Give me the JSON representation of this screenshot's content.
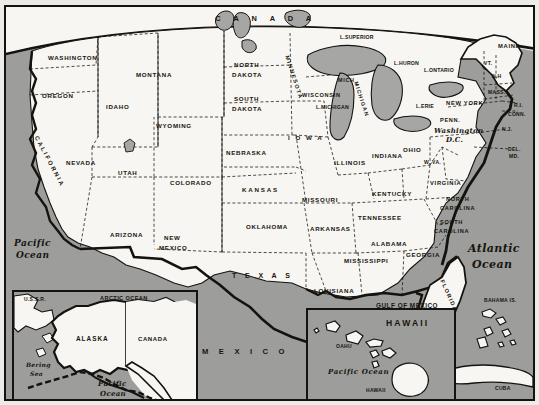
{
  "map": {
    "title": "United States political map with Alaska and Hawaii insets",
    "colors": {
      "ocean": "#9d9d9b",
      "land": "#f7f6f2",
      "border": "#15130f",
      "lake": "#a6a6a4",
      "paper": "#ecebe7"
    },
    "countries": [
      {
        "name": "canada-label",
        "text": "C A N A D A",
        "x": 160,
        "y": 10
      },
      {
        "name": "mexico-label",
        "text": "M E X I C O",
        "x": 196,
        "y": 343
      },
      {
        "name": "cuba-label",
        "text": "CUBA",
        "x": 489,
        "y": 381
      },
      {
        "name": "bahama-label",
        "text": "BAHAMA IS.",
        "x": 482,
        "y": 293
      },
      {
        "name": "ussr-label",
        "text": "U.S.S.R.",
        "x": 16,
        "y": 288
      }
    ],
    "oceans": [
      {
        "name": "pacific-ocean-west",
        "line1": "Pacific",
        "line2": "Ocean",
        "x": 10,
        "y": 236
      },
      {
        "name": "atlantic-ocean",
        "line1": "Atlantic",
        "line2": "Ocean",
        "x": 462,
        "y": 240
      },
      {
        "name": "gulf-of-mexico",
        "text": "GULF OF MEXICO",
        "x": 374,
        "y": 298
      },
      {
        "name": "arctic-ocean",
        "text": "ARCTIC OCEAN",
        "x": 128,
        "y": 287
      },
      {
        "name": "bering-sea",
        "line1": "Bering",
        "line2": "Sea",
        "x": 17,
        "y": 356
      },
      {
        "name": "pacific-ocean-alaska",
        "line1": "Pacific",
        "line2": "Ocean",
        "x": 92,
        "y": 376
      },
      {
        "name": "pacific-ocean-hawaii",
        "text": "Pacific  Ocean",
        "x": 322,
        "y": 362
      }
    ],
    "lakes": [
      {
        "name": "lake-superior",
        "text": "L.SUPERIOR",
        "x": 334,
        "y": 30
      },
      {
        "name": "lake-huron",
        "text": "L.HURON",
        "x": 388,
        "y": 56
      },
      {
        "name": "lake-ontario",
        "text": "L.ONTARIO",
        "x": 418,
        "y": 63
      },
      {
        "name": "lake-erie",
        "text": "L.ERIE",
        "x": 410,
        "y": 99
      },
      {
        "name": "lake-michigan",
        "text": "L.MICHIGAN",
        "x": 316,
        "y": 100
      }
    ],
    "states": [
      {
        "name": "washington",
        "text": "WASHINGTON",
        "x": 68,
        "y": 50
      },
      {
        "name": "oregon",
        "text": "OREGON",
        "x": 46,
        "y": 88
      },
      {
        "name": "idaho",
        "text": "IDAHO",
        "x": 104,
        "y": 99
      },
      {
        "name": "montana",
        "text": "MONTANA",
        "x": 155,
        "y": 67
      },
      {
        "name": "wyoming",
        "text": "WYOMING",
        "x": 164,
        "y": 118
      },
      {
        "name": "nevada",
        "text": "NEVADA",
        "x": 76,
        "y": 155
      },
      {
        "name": "utah",
        "text": "UTAH",
        "x": 124,
        "y": 165
      },
      {
        "name": "colorado",
        "text": "COLORADO",
        "x": 178,
        "y": 175
      },
      {
        "name": "arizona",
        "text": "ARIZONA",
        "x": 119,
        "y": 227
      },
      {
        "name": "new-mexico",
        "line1": "NEW",
        "line2": "MEXICO",
        "x": 175,
        "y": 232
      },
      {
        "name": "california",
        "text": "CALIFORNIA",
        "x": 33,
        "y": 140
      },
      {
        "name": "north-dakota",
        "line1": "NORTH",
        "line2": "DAKOTA",
        "x": 245,
        "y": 59
      },
      {
        "name": "south-dakota",
        "line1": "SOUTH",
        "line2": "DAKOTA",
        "x": 243,
        "y": 93
      },
      {
        "name": "nebraska",
        "text": "NEBRASKA",
        "x": 244,
        "y": 145
      },
      {
        "name": "kansas",
        "text": "KANSAS",
        "x": 257,
        "y": 182
      },
      {
        "name": "oklahoma",
        "text": "OKLAHOMA",
        "x": 263,
        "y": 219
      },
      {
        "name": "texas",
        "text": "T E X A S",
        "x": 237,
        "y": 268
      },
      {
        "name": "minnesota",
        "text": "MINNESOTA",
        "x": 283,
        "y": 55
      },
      {
        "name": "iowa",
        "text": "I O W A",
        "x": 293,
        "y": 130
      },
      {
        "name": "missouri",
        "text": "MISSOURI",
        "x": 307,
        "y": 192
      },
      {
        "name": "arkansas",
        "text": "ARKANSAS",
        "x": 315,
        "y": 221
      },
      {
        "name": "louisiana",
        "text": "LOUISIANA",
        "x": 317,
        "y": 283
      },
      {
        "name": "mississippi",
        "text": "MISSISSIPPI",
        "x": 351,
        "y": 253
      },
      {
        "name": "alabama",
        "text": "ALABAMA",
        "x": 378,
        "y": 236
      },
      {
        "name": "georgia",
        "text": "GEORGIA",
        "x": 412,
        "y": 247
      },
      {
        "name": "tennessee",
        "text": "TENNESSEE",
        "x": 365,
        "y": 210
      },
      {
        "name": "kentucky",
        "text": "KENTUCKY",
        "x": 378,
        "y": 186
      },
      {
        "name": "illinois",
        "text": "ILLINOIS",
        "x": 337,
        "y": 155
      },
      {
        "name": "indiana",
        "text": "INDIANA",
        "x": 374,
        "y": 148
      },
      {
        "name": "ohio",
        "text": "OHIO",
        "x": 403,
        "y": 142
      },
      {
        "name": "michigan",
        "text": "MICHIGAN",
        "x": 378,
        "y": 78
      },
      {
        "name": "mich",
        "text": "MICH",
        "x": 339,
        "y": 73
      },
      {
        "name": "wisconsin",
        "text": "WISCONSIN",
        "x": 313,
        "y": 88
      },
      {
        "name": "west-virginia",
        "text": "W. VA.",
        "x": 422,
        "y": 155
      },
      {
        "name": "virginia",
        "text": "VIRGINIA",
        "x": 437,
        "y": 175
      },
      {
        "name": "north-carolina",
        "line1": "NORTH",
        "line2": "CAROLINA",
        "x": 451,
        "y": 193
      },
      {
        "name": "south-carolina",
        "line1": "SOUTH",
        "line2": "CAROLINA",
        "x": 444,
        "y": 216
      },
      {
        "name": "florida",
        "text": "FLORIDA",
        "x": 444,
        "y": 277
      },
      {
        "name": "pennsylvania",
        "text": "PENN.",
        "x": 440,
        "y": 113
      },
      {
        "name": "new-york",
        "text": "NEW YORK",
        "x": 450,
        "y": 95
      },
      {
        "name": "maine",
        "text": "MAINE",
        "x": 504,
        "y": 38
      },
      {
        "name": "vermont",
        "text": "VT.",
        "x": 484,
        "y": 56
      },
      {
        "name": "new-hampshire",
        "text": "N.H",
        "x": 492,
        "y": 69
      },
      {
        "name": "massachusetts",
        "text": "MASS.",
        "x": 492,
        "y": 85
      },
      {
        "name": "rhode-island",
        "text": "R.I.",
        "x": 514,
        "y": 98
      },
      {
        "name": "connecticut",
        "text": "CONN.",
        "x": 508,
        "y": 107
      },
      {
        "name": "new-jersey",
        "text": "N.J.",
        "x": 500,
        "y": 122
      },
      {
        "name": "delaware",
        "text": "DEL.",
        "x": 506,
        "y": 142
      },
      {
        "name": "maryland",
        "text": "MD.",
        "x": 507,
        "y": 149
      },
      {
        "name": "washington-dc",
        "line1": "Washington",
        "line2": "D.C.",
        "x": 437,
        "y": 123
      }
    ],
    "alaska_inset": {
      "name": "alaska-inset",
      "labels": [
        {
          "name": "alaska-label",
          "text": "ALASKA",
          "x": 76,
          "y": 45
        },
        {
          "name": "canada-label-inset",
          "text": "CANADA",
          "x": 128,
          "y": 45
        }
      ]
    },
    "hawaii_inset": {
      "name": "hawaii-inset",
      "labels": [
        {
          "name": "hawaii-title",
          "text": "HAWAII",
          "x": 82,
          "y": 11
        },
        {
          "name": "oahu-label",
          "text": "OAHU",
          "x": 33,
          "y": 36
        },
        {
          "name": "hawaii-island-label",
          "text": "HAWAII",
          "x": 63,
          "y": 80
        }
      ]
    }
  }
}
